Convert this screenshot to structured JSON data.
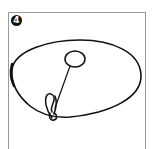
{
  "step": {
    "number": "4",
    "badge_color": "#111111"
  },
  "illustration": {
    "description": "Oval shape with a small circle connected by a string to a safety pin at the lower edge",
    "elements": [
      "large-oval",
      "small-circle",
      "string",
      "safety-pin"
    ],
    "stroke_color": "#111111"
  }
}
